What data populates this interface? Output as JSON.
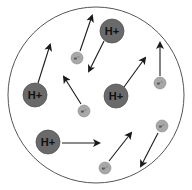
{
  "diagram": {
    "title": "",
    "colors": {
      "background": "#ffffff",
      "container_stroke": "#555555",
      "ion_fill": "#6a6a6a",
      "ion_stroke": "#555555",
      "electron_fill": "#a8a8a8",
      "electron_stroke": "#8a8a8a",
      "arrow": "#1a1a1a"
    },
    "container": {
      "cx": 96,
      "cy": 95,
      "r": 88
    },
    "ions": [
      {
        "label": "H+",
        "cx": 112,
        "cy": 31,
        "r": 12,
        "arrow": {
          "x1": 104,
          "y1": 41,
          "x2": 89,
          "y2": 71
        }
      },
      {
        "label": "H+",
        "cx": 35,
        "cy": 95,
        "r": 12,
        "arrow": {
          "x1": 38,
          "y1": 83,
          "x2": 50,
          "y2": 45
        }
      },
      {
        "label": "H+",
        "cx": 116,
        "cy": 96,
        "r": 12,
        "arrow": {
          "x1": 124,
          "y1": 87,
          "x2": 145,
          "y2": 58
        }
      },
      {
        "label": "H+",
        "cx": 48,
        "cy": 142,
        "r": 12,
        "arrow": {
          "x1": 62,
          "y1": 143,
          "x2": 99,
          "y2": 143
        }
      }
    ],
    "electrons": [
      {
        "label": "e⁻",
        "cx": 77,
        "cy": 58,
        "r": 6,
        "arrow": {
          "x1": 80,
          "y1": 51,
          "x2": 92,
          "y2": 16
        }
      },
      {
        "label": "e⁻",
        "cx": 84,
        "cy": 111,
        "r": 6,
        "arrow": {
          "x1": 81,
          "y1": 104,
          "x2": 64,
          "y2": 77
        }
      },
      {
        "label": "e⁻",
        "cx": 160,
        "cy": 83,
        "r": 6,
        "arrow": {
          "x1": 160,
          "y1": 76,
          "x2": 160,
          "y2": 43
        }
      },
      {
        "label": "e⁻",
        "cx": 162,
        "cy": 126,
        "r": 6,
        "arrow": {
          "x1": 158,
          "y1": 133,
          "x2": 141,
          "y2": 166
        }
      },
      {
        "label": "e⁻",
        "cx": 105,
        "cy": 168,
        "r": 6,
        "arrow": {
          "x1": 109,
          "y1": 161,
          "x2": 131,
          "y2": 133
        }
      }
    ]
  }
}
